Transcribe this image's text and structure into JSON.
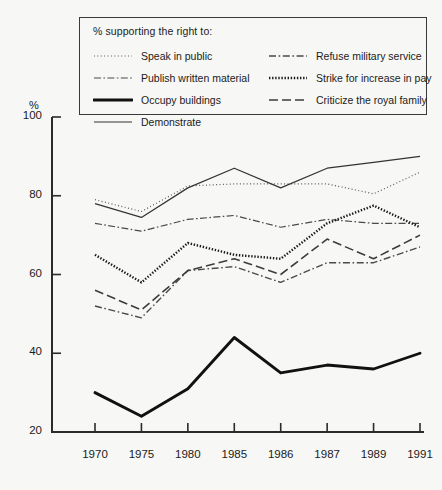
{
  "legend": {
    "title": "% supporting the right to:",
    "items": [
      {
        "label": "Speak in public",
        "style": "fine-dotted",
        "col": 0,
        "row": 0
      },
      {
        "label": "Publish written material",
        "style": "dash-dot-fine",
        "col": 0,
        "row": 1
      },
      {
        "label": "Occupy buildings",
        "style": "thick-solid",
        "col": 0,
        "row": 2
      },
      {
        "label": "Demonstrate",
        "style": "thin-solid",
        "col": 0,
        "row": 3
      },
      {
        "label": "Refuse military service",
        "style": "dash-dot",
        "col": 1,
        "row": 0
      },
      {
        "label": "Strike for increase in pay",
        "style": "thick-dotted",
        "col": 1,
        "row": 1
      },
      {
        "label": "Criticize the royal family",
        "style": "long-dash",
        "col": 1,
        "row": 2
      }
    ]
  },
  "axes": {
    "y_unit": "%",
    "y_ticks": [
      "100",
      "80",
      "60",
      "40",
      "20"
    ],
    "x_ticks": [
      "1970",
      "1975",
      "1980",
      "1985",
      "1986",
      "1987",
      "1989",
      "1991"
    ]
  },
  "chart_data": {
    "type": "line",
    "title": "",
    "subtitle": "% supporting the right to:",
    "xlabel": "",
    "ylabel": "%",
    "ylim": [
      20,
      100
    ],
    "yticks": [
      20,
      40,
      60,
      80,
      100
    ],
    "grid": false,
    "legend_position": "top-inside",
    "categories": [
      "1970",
      "1975",
      "1980",
      "1985",
      "1986",
      "1987",
      "1989",
      "1991"
    ],
    "series": [
      {
        "name": "Speak in public",
        "style": "fine-dotted",
        "values": [
          79,
          76,
          82.5,
          83,
          83,
          83,
          80.5,
          86
        ]
      },
      {
        "name": "Publish written material",
        "style": "dash-dot-fine",
        "values": [
          73,
          71,
          74,
          75,
          72,
          74,
          73,
          73
        ]
      },
      {
        "name": "Occupy buildings",
        "style": "thick-solid",
        "values": [
          30,
          24,
          31,
          44,
          35,
          37,
          36,
          40
        ]
      },
      {
        "name": "Demonstrate",
        "style": "thin-solid",
        "values": [
          78,
          74.5,
          82,
          87,
          82,
          87,
          88.5,
          90
        ]
      },
      {
        "name": "Refuse military service",
        "style": "dash-dot",
        "values": [
          52,
          49,
          61,
          62,
          58,
          63,
          63,
          67
        ]
      },
      {
        "name": "Strike for increase in pay",
        "style": "thick-dotted",
        "values": [
          65,
          58,
          68,
          65,
          64,
          73,
          77.5,
          72
        ]
      },
      {
        "name": "Criticize the royal family",
        "style": "long-dash",
        "values": [
          56,
          51,
          61,
          64,
          60,
          69,
          64,
          70
        ]
      }
    ]
  }
}
